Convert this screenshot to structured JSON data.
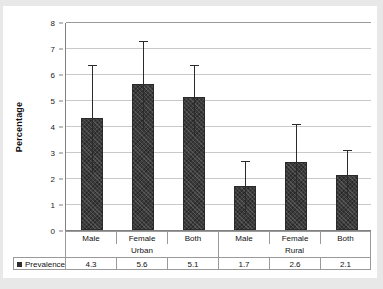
{
  "chart_data": {
    "type": "bar",
    "title": "",
    "xlabel": "",
    "ylabel": "Percentage",
    "ylim": [
      0,
      8
    ],
    "yticks": [
      0,
      1,
      2,
      3,
      4,
      5,
      6,
      7,
      8
    ],
    "grid": true,
    "legend_position": "bottom-table",
    "categories": [
      "Male",
      "Female",
      "Both",
      "Male",
      "Female",
      "Both"
    ],
    "groups": [
      {
        "label": "Urban",
        "span": 3
      },
      {
        "label": "Rural",
        "span": 3
      }
    ],
    "series": [
      {
        "name": "Prevalence",
        "values": [
          4.3,
          5.6,
          5.1,
          1.7,
          2.6,
          2.1
        ],
        "error_low": [
          2.2,
          3.9,
          3.7,
          0.65,
          1.15,
          1.25
        ],
        "error_high": [
          6.4,
          7.3,
          6.4,
          2.7,
          4.1,
          3.1
        ],
        "color": "#3b3b3b"
      }
    ]
  },
  "axis": {
    "y_title": "Percentage",
    "y_tick_labels": [
      "0",
      "1",
      "2",
      "3",
      "4",
      "5",
      "6",
      "7",
      "8"
    ]
  },
  "data_table": {
    "legend_label": "Prevalence",
    "legend_marker": "square-marker",
    "category_row": [
      "Male",
      "Female",
      "Both",
      "Male",
      "Female",
      "Both"
    ],
    "group_row": [
      "Urban",
      "Rural"
    ],
    "value_row": [
      "4.3",
      "5.6",
      "5.1",
      "1.7",
      "2.6",
      "2.1"
    ]
  },
  "colors": {
    "bar_fill": "#3b3b3b",
    "gridline": "#c9c9c9",
    "axis": "#808080",
    "panel_background": "#ffffff",
    "page_background": "#e8e8e8"
  }
}
